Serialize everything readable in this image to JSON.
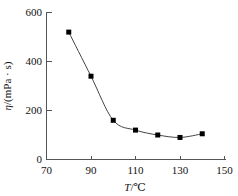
{
  "chart_data": {
    "type": "line",
    "title": "",
    "subtitle": "",
    "xlabel": "T/℃",
    "ylabel": "η/(mPa · s)",
    "xlabel_parts": {
      "symbol": "T",
      "rest": "/℃"
    },
    "ylabel_parts": {
      "symbol": "η",
      "rest": "/(mPa · s)"
    },
    "xlim": [
      70,
      150
    ],
    "ylim": [
      0,
      600
    ],
    "xticks": [
      70,
      90,
      110,
      130,
      150
    ],
    "yticks": [
      0,
      200,
      400,
      600
    ],
    "xtick_labels": [
      "70",
      "90",
      "110",
      "130",
      "150"
    ],
    "ytick_labels": [
      "0",
      "200",
      "400",
      "600"
    ],
    "grid": false,
    "legend": false,
    "legend_position": "none",
    "marker": "square",
    "marker_color": "#000000",
    "line_color": "#444444",
    "x": [
      80,
      90,
      100,
      110,
      120,
      130,
      140
    ],
    "values": [
      520,
      340,
      160,
      120,
      100,
      90,
      105
    ],
    "series": [
      {
        "name": "viscosity",
        "x": [
          80,
          90,
          100,
          110,
          120,
          130,
          140
        ],
        "values": [
          520,
          340,
          160,
          120,
          100,
          90,
          105
        ]
      }
    ],
    "points": [
      {
        "x": 80,
        "y": 520
      },
      {
        "x": 90,
        "y": 340
      },
      {
        "x": 100,
        "y": 160
      },
      {
        "x": 110,
        "y": 120
      },
      {
        "x": 120,
        "y": 100
      },
      {
        "x": 130,
        "y": 90
      },
      {
        "x": 140,
        "y": 105
      }
    ],
    "annotations": []
  }
}
